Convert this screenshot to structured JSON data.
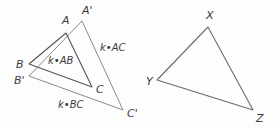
{
  "figure": {
    "background_color": "#fdfdfd",
    "stroke_color": "#555555",
    "stroke_color_light": "#8a8a8a",
    "text_color": "#3a3a3a",
    "caption": "Two triangles illustrating a dilation by scale factor k and a separate triangle XYZ"
  },
  "chart_data": {
    "type": "diagram",
    "title": "",
    "shapes": [
      {
        "name": "triangle-ABC",
        "kind": "triangle",
        "vertices": [
          {
            "label": "A",
            "x": 66,
            "y": 33
          },
          {
            "label": "B",
            "x": 29,
            "y": 64
          },
          {
            "label": "C",
            "x": 92,
            "y": 87
          }
        ]
      },
      {
        "name": "triangle-A-prime-B-prime-C-prime",
        "kind": "triangle",
        "vertices": [
          {
            "label": "A'",
            "x": 82,
            "y": 21
          },
          {
            "label": "B'",
            "x": 29,
            "y": 76
          },
          {
            "label": "C'",
            "x": 123,
            "y": 110
          }
        ]
      },
      {
        "name": "triangle-XYZ",
        "kind": "triangle",
        "vertices": [
          {
            "label": "X",
            "x": 208,
            "y": 27
          },
          {
            "label": "Y",
            "x": 157,
            "y": 80
          },
          {
            "label": "Z",
            "x": 253,
            "y": 110
          }
        ]
      }
    ],
    "vertex_labels": [
      {
        "name": "vertex-label-A",
        "text": "A",
        "x": 62,
        "y": 24
      },
      {
        "name": "vertex-label-A-prime",
        "text": "A'",
        "x": 82,
        "y": 14
      },
      {
        "name": "vertex-label-B",
        "text": "B",
        "x": 16,
        "y": 68
      },
      {
        "name": "vertex-label-B-prime",
        "text": "B'",
        "x": 14,
        "y": 84
      },
      {
        "name": "vertex-label-C",
        "text": "C",
        "x": 96,
        "y": 93
      },
      {
        "name": "vertex-label-C-prime",
        "text": "C'",
        "x": 127,
        "y": 117
      },
      {
        "name": "vertex-label-X",
        "text": "X",
        "x": 206,
        "y": 19
      },
      {
        "name": "vertex-label-Y",
        "text": "Y",
        "x": 146,
        "y": 85
      },
      {
        "name": "vertex-label-Z",
        "text": "Z",
        "x": 256,
        "y": 122
      }
    ],
    "side_labels": [
      {
        "name": "side-label-k-AB",
        "text": "k•AB",
        "x": 48,
        "y": 64
      },
      {
        "name": "side-label-k-AC",
        "text": "k•AC",
        "x": 100,
        "y": 51
      },
      {
        "name": "side-label-k-BC",
        "text": "k•BC",
        "x": 58,
        "y": 108
      }
    ]
  }
}
